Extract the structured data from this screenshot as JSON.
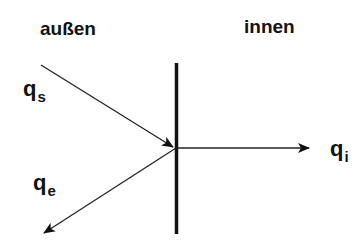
{
  "diagram": {
    "regions": {
      "outside": "außen",
      "inside": "innen"
    },
    "flows": {
      "incoming": {
        "symbol": "q",
        "subscript": "s"
      },
      "emitted": {
        "symbol": "q",
        "subscript": "e"
      },
      "internal": {
        "symbol": "q",
        "subscript": "i"
      }
    },
    "colors": {
      "ink": "#111111",
      "background": "#ffffff"
    }
  }
}
